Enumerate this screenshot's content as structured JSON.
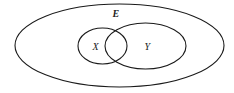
{
  "diagram": {
    "type": "venn",
    "universal_set": {
      "label": "E"
    },
    "sets": [
      {
        "label": "X"
      },
      {
        "label": "Y"
      }
    ],
    "stroke_color": "#1a1a1a",
    "background": "#ffffff"
  }
}
